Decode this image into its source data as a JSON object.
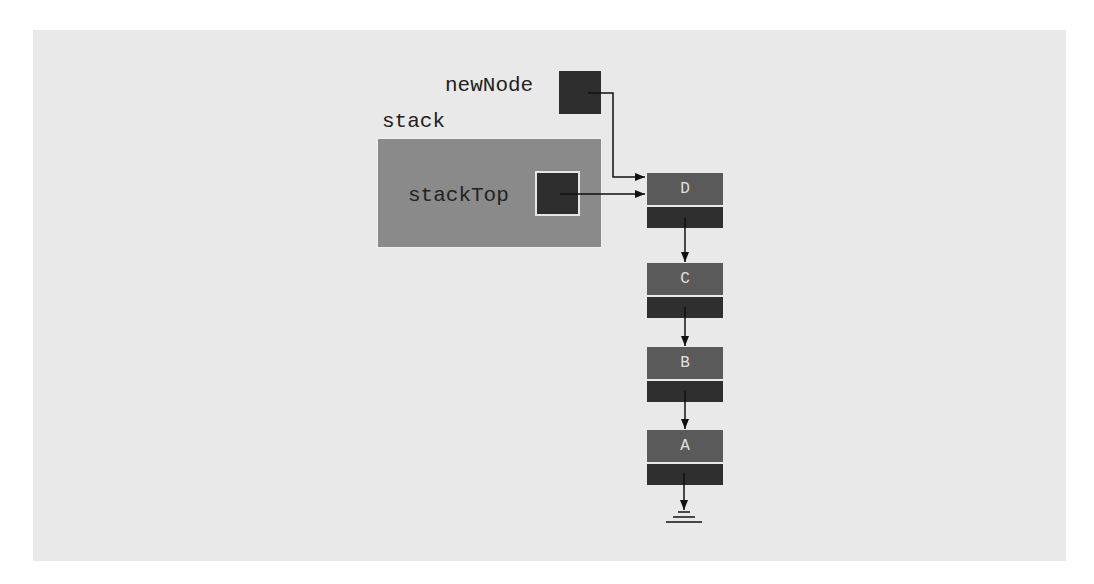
{
  "diagram": {
    "title": "",
    "labels": {
      "new_node": "newNode",
      "stack": "stack",
      "stack_top": "stackTop"
    },
    "nodes": [
      {
        "value": "D",
        "next": "C"
      },
      {
        "value": "C",
        "next": "B"
      },
      {
        "value": "B",
        "next": "A"
      },
      {
        "value": "A",
        "next": "null"
      }
    ],
    "pointers": [
      {
        "from": "newNode",
        "to": "D"
      },
      {
        "from": "stackTop",
        "to": "D"
      }
    ],
    "terminator_icon": "ground-null-icon"
  }
}
